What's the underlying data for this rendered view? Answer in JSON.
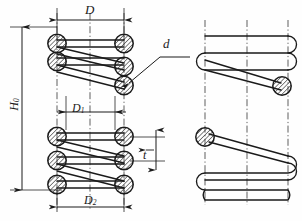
{
  "drawing": {
    "title": "Helical compression spring dimensioned drawing",
    "background_color": "#fefefe",
    "line_color": "#1a1a1a",
    "hatch_color": "#2a2a2a",
    "views": [
      {
        "name": "sectional-view",
        "description": "Left view: spring shown in section with hatched circular wire cross-sections"
      },
      {
        "name": "outline-view",
        "description": "Right view: spring shown in outline with one hatched wire cross-section per half"
      }
    ],
    "labels": {
      "outer_diameter": "D",
      "free_height": "H",
      "free_height_sub": "0",
      "inner_diameter": "D",
      "inner_diameter_sub": "1",
      "mean_diameter": "D",
      "mean_diameter_sub": "2",
      "wire_diameter": "d",
      "pitch": "t"
    },
    "dimension_lines": [
      {
        "name": "D",
        "orientation": "horizontal",
        "position": "top"
      },
      {
        "name": "H0",
        "orientation": "vertical",
        "position": "left"
      },
      {
        "name": "D1",
        "orientation": "horizontal",
        "position": "middle"
      },
      {
        "name": "D2",
        "orientation": "horizontal",
        "position": "bottom"
      },
      {
        "name": "t",
        "orientation": "vertical",
        "position": "right"
      },
      {
        "name": "d",
        "orientation": "leader",
        "position": "upper-right"
      }
    ]
  }
}
